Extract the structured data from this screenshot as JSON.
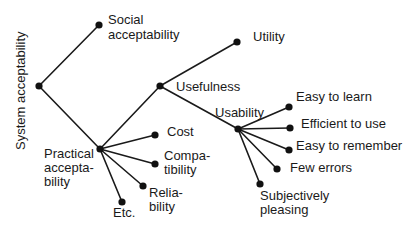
{
  "diagram": {
    "title": "System acceptability",
    "colors": {
      "ink": "#1a1a1a",
      "background": "#ffffff"
    },
    "nodes": {
      "root": {
        "label": "System acceptability",
        "x": 39,
        "y": 86
      },
      "social": {
        "label_lines": [
          "Social",
          "acceptability"
        ],
        "x": 99,
        "y": 25
      },
      "practical": {
        "label_lines": [
          "Practical",
          "accepta-",
          "bility"
        ],
        "x": 100,
        "y": 149
      },
      "usefulness": {
        "label": "Usefulness",
        "x": 160,
        "y": 86
      },
      "utility": {
        "label": "Utility",
        "x": 237,
        "y": 42
      },
      "usability": {
        "label": "Usability",
        "x": 238,
        "y": 129
      },
      "cost": {
        "label": "Cost",
        "x": 155,
        "y": 135
      },
      "compatibility": {
        "label_lines": [
          "Compa-",
          "tibility"
        ],
        "x": 155,
        "y": 164
      },
      "reliability": {
        "label_lines": [
          "Relia-",
          "bility"
        ],
        "x": 143,
        "y": 186
      },
      "etc": {
        "label": "Etc.",
        "x": 122,
        "y": 202
      },
      "easy_to_learn": {
        "label": "Easy to learn",
        "x": 289,
        "y": 107
      },
      "efficient_to_use": {
        "label": "Efficient to use",
        "x": 290,
        "y": 128
      },
      "easy_to_remember": {
        "label": "Easy to remember",
        "x": 289,
        "y": 150
      },
      "few_errors": {
        "label": "Few errors",
        "x": 277,
        "y": 169
      },
      "subjectively_pleasing": {
        "label_lines": [
          "Subjectively",
          "pleasing"
        ],
        "x": 260,
        "y": 184
      }
    },
    "edges": [
      [
        "root",
        "social"
      ],
      [
        "root",
        "practical"
      ],
      [
        "practical",
        "usefulness"
      ],
      [
        "practical",
        "cost"
      ],
      [
        "practical",
        "compatibility"
      ],
      [
        "practical",
        "reliability"
      ],
      [
        "practical",
        "etc"
      ],
      [
        "usefulness",
        "utility"
      ],
      [
        "usefulness",
        "usability"
      ],
      [
        "usability",
        "easy_to_learn"
      ],
      [
        "usability",
        "efficient_to_use"
      ],
      [
        "usability",
        "easy_to_remember"
      ],
      [
        "usability",
        "few_errors"
      ],
      [
        "usability",
        "subjectively_pleasing"
      ]
    ]
  }
}
